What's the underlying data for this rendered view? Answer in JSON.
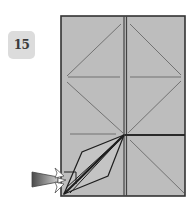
{
  "step": {
    "number": "15"
  },
  "diagram": {
    "type": "origami-fold-step",
    "colors": {
      "paper_fill": "#bdbdbd",
      "paper_edge": "#333333",
      "crease": "#6a6a6a",
      "flap_edge": "#1e1e1e",
      "arrow_fill_dark": "#555555",
      "arrow_fill_light": "#d6d6d6",
      "badge_bg": "#dcdcdc",
      "badge_text": "#3a3a3a"
    },
    "paper": {
      "x": 61,
      "y": 16,
      "width": 124,
      "height": 180
    },
    "center_fold_x": 125,
    "focal_point": {
      "x": 124,
      "y": 135
    },
    "arrows": [
      {
        "name": "push-arrow",
        "direction": "right"
      },
      {
        "name": "open-sink-arrow",
        "direction": "right"
      }
    ]
  }
}
